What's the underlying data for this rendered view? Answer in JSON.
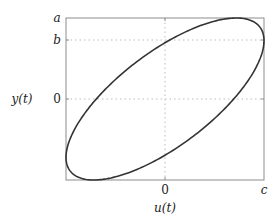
{
  "chart_data": {
    "type": "line",
    "title": "",
    "xlabel": "u(t)",
    "ylabel": "y(t)",
    "xlim": [
      "-c",
      "c"
    ],
    "ylim": [
      "-a",
      "a"
    ],
    "x_ticks": [
      {
        "label": "0",
        "value": 0
      },
      {
        "label": "c",
        "value": "c"
      }
    ],
    "y_ticks": [
      {
        "label": "a",
        "value": "a"
      },
      {
        "label": "b",
        "value": "b"
      },
      {
        "label": "0",
        "value": 0
      }
    ],
    "grid": {
      "style": "dotted",
      "lines": [
        "u=0",
        "y=0",
        "y=b"
      ]
    },
    "normalized": {
      "c": 1.0,
      "a": 1.0,
      "b": 0.72,
      "phase_cos": 0.72,
      "notes": "Rightmost point (c, b); topmost point (~0.72c, a); symmetric about origin"
    },
    "series": [
      {
        "name": "ellipse",
        "param": "t in [0, 2π]",
        "u": "c*sin(t)",
        "y": "a*sin(t+phi)",
        "color": "#333333"
      }
    ]
  },
  "labels": {
    "xlabel": "u(t)",
    "ylabel": "y(t)",
    "tick_a": "a",
    "tick_b": "b",
    "tick_y0": "0",
    "tick_x0": "0",
    "tick_c": "c"
  },
  "colors": {
    "curve": "#333333",
    "frame": "#8c8c8c",
    "grid": "#bdbdbd"
  }
}
